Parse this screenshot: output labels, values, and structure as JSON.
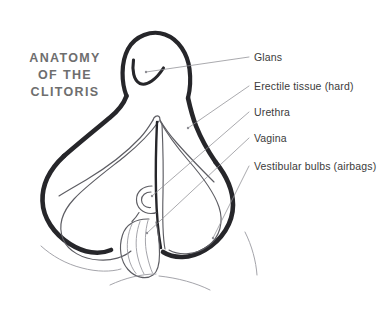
{
  "page": {
    "width": 383,
    "height": 311,
    "background_color": "#ffffff",
    "kind": "anatomical-illustration"
  },
  "title": {
    "full_text": "ANATOMY OF THE CLITORIS",
    "lines": [
      "ANATOMY",
      "OF THE",
      "CLITORIS"
    ],
    "color": "#6e6e6e"
  },
  "labels": [
    {
      "id": "glans",
      "text": "Glans",
      "x": 254,
      "y": 51,
      "leader_from": [
        249,
        57
      ],
      "leader_to": [
        146,
        72
      ],
      "color": "#3b3b3b"
    },
    {
      "id": "erectile-tissue",
      "text": "Erectile tissue (hard)",
      "x": 254,
      "y": 80,
      "leader_from": [
        249,
        86
      ],
      "leader_to": [
        188,
        128
      ],
      "color": "#3b3b3b"
    },
    {
      "id": "urethra",
      "text": "Urethra",
      "x": 254,
      "y": 106,
      "leader_from": [
        249,
        112
      ],
      "leader_to": [
        152,
        196
      ],
      "color": "#3b3b3b"
    },
    {
      "id": "vagina",
      "text": "Vagina",
      "x": 254,
      "y": 132,
      "leader_from": [
        249,
        138
      ],
      "leader_to": [
        147,
        233
      ],
      "color": "#3b3b3b"
    },
    {
      "id": "vestibular-bulbs",
      "text": "Vestibular bulbs (airbags)",
      "x": 254,
      "y": 160,
      "leader_from": [
        249,
        166
      ],
      "leader_to": [
        213,
        238
      ],
      "color": "#3b3b3b"
    }
  ],
  "artwork": {
    "ink_color": "#26262a",
    "secondary_ink_color": "#5d5d63",
    "faint_ink_color": "#9a9aa0",
    "parts": [
      "glans-loop",
      "glans-hook",
      "shaft-left",
      "shaft-right",
      "crus-left",
      "crus-right",
      "bulb-left",
      "bulb-right",
      "urethra-ring",
      "vagina-oval",
      "vagina-rugae"
    ]
  }
}
